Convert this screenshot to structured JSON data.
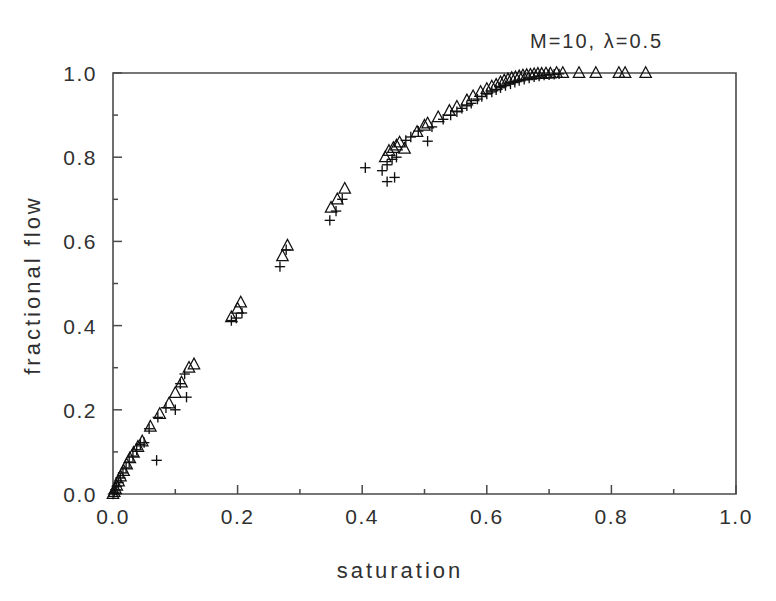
{
  "figure": {
    "title": "M=10,  λ=0.5",
    "title_parts": {
      "m_label": "M=10,",
      "lambda_label": "λ=0.5"
    },
    "background_color": "#ffffff",
    "axis_color": "#4a4a4a",
    "marker_color": "#111111"
  },
  "chart_data": {
    "type": "scatter",
    "title": "M=10,  λ=0.5",
    "xlabel": "saturation",
    "ylabel": "fractional flow",
    "xlim": [
      0.0,
      1.0
    ],
    "ylim": [
      0.0,
      1.0
    ],
    "grid": false,
    "legend": null,
    "xticks": [
      0.0,
      0.2,
      0.4,
      0.6,
      0.8,
      1.0
    ],
    "xticklabels": [
      "0.0",
      "0.2",
      "0.4",
      "0.6",
      "0.8",
      "1.0"
    ],
    "yticks": [
      0.0,
      0.2,
      0.4,
      0.6,
      0.8,
      1.0
    ],
    "yticklabels": [
      "0.0",
      "0.2",
      "0.4",
      "0.6",
      "0.8",
      "1.0"
    ],
    "minor_xticks": [
      0.1,
      0.3,
      0.5,
      0.7,
      0.9
    ],
    "minor_yticks": [
      0.1,
      0.3,
      0.5,
      0.7,
      0.9
    ],
    "series": [
      {
        "name": "triangle-series",
        "marker": "triangle",
        "points": [
          [
            0.0,
            0.0
          ],
          [
            0.002,
            0.005
          ],
          [
            0.004,
            0.012
          ],
          [
            0.006,
            0.02
          ],
          [
            0.009,
            0.03
          ],
          [
            0.012,
            0.042
          ],
          [
            0.017,
            0.055
          ],
          [
            0.022,
            0.07
          ],
          [
            0.027,
            0.085
          ],
          [
            0.033,
            0.098
          ],
          [
            0.04,
            0.112
          ],
          [
            0.047,
            0.125
          ],
          [
            0.06,
            0.16
          ],
          [
            0.075,
            0.19
          ],
          [
            0.09,
            0.215
          ],
          [
            0.1,
            0.24
          ],
          [
            0.11,
            0.265
          ],
          [
            0.122,
            0.3
          ],
          [
            0.13,
            0.308
          ],
          [
            0.19,
            0.42
          ],
          [
            0.2,
            0.44
          ],
          [
            0.205,
            0.455
          ],
          [
            0.272,
            0.565
          ],
          [
            0.28,
            0.59
          ],
          [
            0.35,
            0.68
          ],
          [
            0.36,
            0.7
          ],
          [
            0.372,
            0.725
          ],
          [
            0.437,
            0.8
          ],
          [
            0.443,
            0.815
          ],
          [
            0.45,
            0.822
          ],
          [
            0.455,
            0.828
          ],
          [
            0.46,
            0.835
          ],
          [
            0.468,
            0.82
          ],
          [
            0.488,
            0.86
          ],
          [
            0.5,
            0.875
          ],
          [
            0.505,
            0.88
          ],
          [
            0.522,
            0.895
          ],
          [
            0.54,
            0.91
          ],
          [
            0.552,
            0.92
          ],
          [
            0.568,
            0.935
          ],
          [
            0.578,
            0.945
          ],
          [
            0.59,
            0.955
          ],
          [
            0.6,
            0.962
          ],
          [
            0.608,
            0.968
          ],
          [
            0.615,
            0.972
          ],
          [
            0.622,
            0.978
          ],
          [
            0.628,
            0.982
          ],
          [
            0.634,
            0.985
          ],
          [
            0.64,
            0.988
          ],
          [
            0.646,
            0.99
          ],
          [
            0.652,
            0.992
          ],
          [
            0.658,
            0.994
          ],
          [
            0.664,
            0.995
          ],
          [
            0.67,
            0.996
          ],
          [
            0.676,
            0.997
          ],
          [
            0.682,
            0.998
          ],
          [
            0.688,
            0.998
          ],
          [
            0.695,
            0.999
          ],
          [
            0.702,
            0.999
          ],
          [
            0.712,
            1.0
          ],
          [
            0.722,
            1.0
          ],
          [
            0.748,
            1.0
          ],
          [
            0.775,
            1.0
          ],
          [
            0.812,
            1.0
          ],
          [
            0.822,
            1.0
          ],
          [
            0.855,
            1.0
          ]
        ]
      },
      {
        "name": "plus-series",
        "marker": "plus",
        "points": [
          [
            0.0,
            0.0
          ],
          [
            0.002,
            0.004
          ],
          [
            0.004,
            0.01
          ],
          [
            0.006,
            0.018
          ],
          [
            0.009,
            0.027
          ],
          [
            0.012,
            0.038
          ],
          [
            0.016,
            0.05
          ],
          [
            0.021,
            0.062
          ],
          [
            0.026,
            0.076
          ],
          [
            0.032,
            0.09
          ],
          [
            0.038,
            0.105
          ],
          [
            0.044,
            0.118
          ],
          [
            0.05,
            0.122
          ],
          [
            0.07,
            0.08
          ],
          [
            0.058,
            0.155
          ],
          [
            0.072,
            0.182
          ],
          [
            0.085,
            0.205
          ],
          [
            0.1,
            0.2
          ],
          [
            0.118,
            0.23
          ],
          [
            0.108,
            0.262
          ],
          [
            0.115,
            0.285
          ],
          [
            0.19,
            0.412
          ],
          [
            0.198,
            0.418
          ],
          [
            0.207,
            0.43
          ],
          [
            0.268,
            0.54
          ],
          [
            0.278,
            0.58
          ],
          [
            0.348,
            0.65
          ],
          [
            0.358,
            0.672
          ],
          [
            0.368,
            0.7
          ],
          [
            0.405,
            0.775
          ],
          [
            0.432,
            0.768
          ],
          [
            0.44,
            0.782
          ],
          [
            0.448,
            0.795
          ],
          [
            0.455,
            0.8
          ],
          [
            0.44,
            0.742
          ],
          [
            0.452,
            0.752
          ],
          [
            0.47,
            0.84
          ],
          [
            0.478,
            0.848
          ],
          [
            0.49,
            0.862
          ],
          [
            0.505,
            0.838
          ],
          [
            0.512,
            0.872
          ],
          [
            0.53,
            0.89
          ],
          [
            0.542,
            0.9
          ],
          [
            0.552,
            0.908
          ],
          [
            0.56,
            0.916
          ],
          [
            0.568,
            0.922
          ],
          [
            0.575,
            0.928
          ],
          [
            0.585,
            0.938
          ],
          [
            0.592,
            0.944
          ],
          [
            0.6,
            0.95
          ],
          [
            0.608,
            0.955
          ],
          [
            0.615,
            0.96
          ],
          [
            0.622,
            0.965
          ],
          [
            0.63,
            0.97
          ],
          [
            0.638,
            0.974
          ],
          [
            0.645,
            0.978
          ],
          [
            0.652,
            0.982
          ],
          [
            0.66,
            0.985
          ],
          [
            0.668,
            0.988
          ],
          [
            0.676,
            0.991
          ],
          [
            0.684,
            0.993
          ],
          [
            0.692,
            0.995
          ],
          [
            0.7,
            0.996
          ],
          [
            0.708,
            0.997
          ],
          [
            0.716,
            0.998
          ]
        ]
      }
    ]
  }
}
